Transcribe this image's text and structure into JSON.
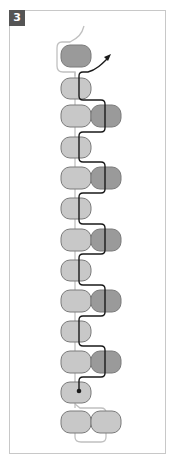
{
  "step": {
    "number": "3"
  },
  "colors": {
    "frame_border": "#c8c8c8",
    "badge_bg": "#555555",
    "badge_text": "#ffffff",
    "bead_light": "#c8c8c8",
    "bead_dark": "#9a9a9a",
    "bead_stroke": "#7a7a7a",
    "thread_light": "#c0c0c0",
    "thread_dark": "#1a1a1a"
  },
  "diagram": {
    "beads": [
      {
        "row": 1,
        "position": "left",
        "shade": "dark"
      },
      {
        "row": 2,
        "position": "left",
        "shade": "light"
      },
      {
        "row": 3,
        "position": "left",
        "shade": "light"
      },
      {
        "row": 3,
        "position": "right",
        "shade": "dark"
      },
      {
        "row": 4,
        "position": "left",
        "shade": "light"
      },
      {
        "row": 5,
        "position": "left",
        "shade": "light"
      },
      {
        "row": 5,
        "position": "right",
        "shade": "dark"
      },
      {
        "row": 6,
        "position": "left",
        "shade": "light"
      },
      {
        "row": 7,
        "position": "left",
        "shade": "light"
      },
      {
        "row": 7,
        "position": "right",
        "shade": "dark"
      },
      {
        "row": 8,
        "position": "left",
        "shade": "light"
      },
      {
        "row": 9,
        "position": "left",
        "shade": "light"
      },
      {
        "row": 9,
        "position": "right",
        "shade": "dark"
      },
      {
        "row": 10,
        "position": "left",
        "shade": "light"
      },
      {
        "row": 11,
        "position": "left",
        "shade": "light"
      },
      {
        "row": 11,
        "position": "right",
        "shade": "dark"
      },
      {
        "row": 12,
        "position": "left",
        "shade": "light"
      },
      {
        "row": 13,
        "position": "left",
        "shade": "light"
      },
      {
        "row": 13,
        "position": "right",
        "shade": "light"
      }
    ],
    "thread_start_marker": "dot",
    "thread_end_marker": "arrow"
  }
}
